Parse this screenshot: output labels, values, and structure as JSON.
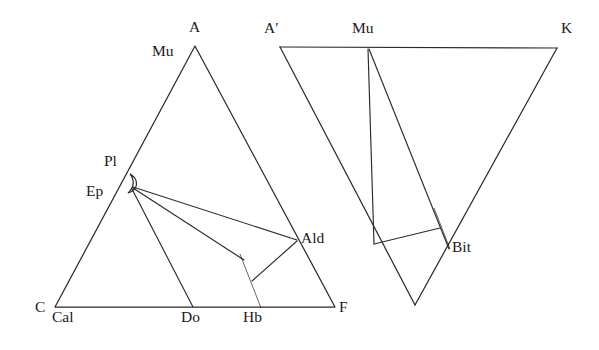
{
  "figure": {
    "type": "acf-afm-chemographic-diagram",
    "background_color": "#ffffff",
    "line_color": "#2b2b2b",
    "fill_color": "#000000",
    "panels": [
      {
        "id": "left",
        "name": "ACF-triangle",
        "vertices": [
          {
            "key": "A",
            "label": "A",
            "x": 195,
            "y": 46,
            "label_x": 189,
            "label_y": 32
          },
          {
            "key": "C",
            "label": "C",
            "x": 55,
            "y": 307,
            "label_x": 35,
            "label_y": 312
          },
          {
            "key": "F",
            "label": "F",
            "x": 335,
            "y": 307,
            "label_x": 339,
            "label_y": 312
          }
        ],
        "points": [
          {
            "key": "Mu",
            "label": "Mu",
            "x": 195,
            "y": 46,
            "label_x": 152,
            "label_y": 56
          },
          {
            "key": "Pl",
            "label": "Pl",
            "x": 130,
            "y": 178,
            "label_x": 104,
            "label_y": 166
          },
          {
            "key": "Ep",
            "label": "Ep",
            "x": 132,
            "y": 187,
            "label_x": 86,
            "label_y": 196
          },
          {
            "key": "Ald",
            "label": "Ald",
            "x": 297,
            "y": 240,
            "label_x": 301,
            "label_y": 243
          },
          {
            "key": "Cal",
            "label": "Cal",
            "x": 60,
            "y": 307,
            "label_x": 52,
            "label_y": 322
          },
          {
            "key": "Do",
            "label": "Do",
            "x": 193,
            "y": 307,
            "label_x": 181,
            "label_y": 322
          },
          {
            "key": "Hb",
            "label": "Hb",
            "x": 258,
            "y": 307,
            "label_x": 243,
            "label_y": 322
          }
        ]
      },
      {
        "id": "right",
        "name": "AKF-triangle",
        "vertices": [
          {
            "key": "Aprime",
            "label": "A′",
            "x": 280,
            "y": 47,
            "label_x": 264,
            "label_y": 33
          },
          {
            "key": "K",
            "label": "K",
            "x": 557,
            "y": 48,
            "label_x": 561,
            "label_y": 33
          },
          {
            "key": "Fbot",
            "label": "",
            "x": 415,
            "y": 305,
            "label_x": 0,
            "label_y": 0
          }
        ],
        "points": [
          {
            "key": "Mu",
            "label": "Mu",
            "x": 368,
            "y": 47,
            "label_x": 352,
            "label_y": 33
          },
          {
            "key": "Bit",
            "label": "Bit",
            "x": 448,
            "y": 246,
            "label_x": 452,
            "label_y": 252
          }
        ]
      }
    ],
    "phase_bars": [
      {
        "key": "Hb-bar",
        "panel": "left",
        "x1": 240,
        "y1": 254,
        "x2": 261,
        "y2": 308,
        "width": 9
      },
      {
        "key": "Bit-bar",
        "panel": "right",
        "x1": 434,
        "y1": 208,
        "x2": 450,
        "y2": 249,
        "width": 8
      }
    ]
  }
}
